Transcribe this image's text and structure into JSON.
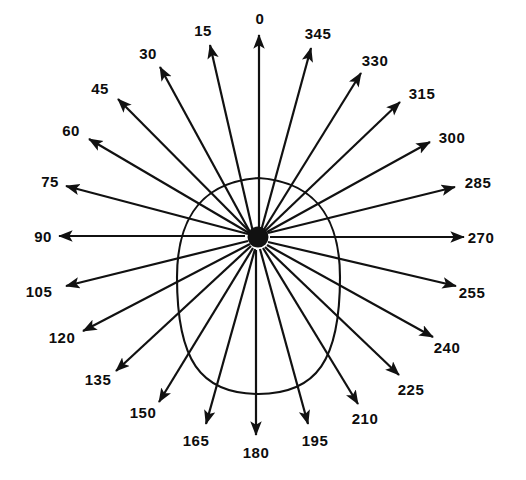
{
  "figure": {
    "type": "polar-direction-diagram",
    "background_color": "#ffffff",
    "stroke_color": "#111111",
    "label_color": "#0d0d0d",
    "width": 526,
    "height": 480,
    "center": {
      "x": 258,
      "y": 237
    },
    "angle_step_degrees": 15,
    "ray_count": 24,
    "label_direction": "counter-clockwise",
    "zero_position": "top"
  },
  "outline": {
    "name": "egg-shaped-curve",
    "top_y": 178,
    "bottom_y": 394,
    "left_x": 177,
    "right_x": 340,
    "description": "closed egg-shaped outline, narrow end upward, drawn around the centre point"
  },
  "chart_data": {
    "type": "line",
    "title": "",
    "subtitle": "",
    "xlabel": "",
    "ylabel": "",
    "legend": [],
    "grid": false,
    "coordinate_system": "polar",
    "angle_unit": "degrees",
    "angles": [
      0,
      15,
      30,
      45,
      60,
      75,
      90,
      105,
      120,
      135,
      150,
      165,
      180,
      195,
      210,
      225,
      240,
      255,
      270,
      285,
      300,
      315,
      330,
      345
    ],
    "tick_labels": [
      "0",
      "15",
      "30",
      "45",
      "60",
      "75",
      "90",
      "105",
      "120",
      "135",
      "150",
      "165",
      "180",
      "195",
      "210",
      "225",
      "240",
      "255",
      "270",
      "285",
      "300",
      "315",
      "330",
      "345"
    ],
    "series": [
      {
        "name": "egg-shaped-outline",
        "values": [
          71,
          72,
          75,
          79,
          79,
          80,
          81,
          86,
          93,
          100,
          107,
          112,
          115,
          112,
          107,
          100,
          93,
          86,
          81,
          80,
          79,
          79,
          75,
          72
        ]
      }
    ]
  },
  "rays": [
    {
      "label": "0",
      "angle": 0,
      "label_x": 260,
      "label_y": 18,
      "arrow_tip_x": 259,
      "arrow_tip_y": 35,
      "tail_x": 259,
      "tail_y": 232
    },
    {
      "label": "15",
      "angle": 15,
      "label_x": 203,
      "label_y": 30,
      "arrow_tip_x": 210,
      "arrow_tip_y": 45,
      "tail_x": 253,
      "tail_y": 232
    },
    {
      "label": "30",
      "angle": 30,
      "label_x": 148,
      "label_y": 53,
      "arrow_tip_x": 160,
      "arrow_tip_y": 67,
      "tail_x": 250,
      "tail_y": 232
    },
    {
      "label": "45",
      "angle": 45,
      "label_x": 100,
      "label_y": 88,
      "arrow_tip_x": 118,
      "arrow_tip_y": 99,
      "tail_x": 250,
      "tail_y": 232
    },
    {
      "label": "60",
      "angle": 60,
      "label_x": 71,
      "label_y": 130,
      "arrow_tip_x": 89,
      "arrow_tip_y": 139,
      "tail_x": 249,
      "tail_y": 233
    },
    {
      "label": "75",
      "angle": 75,
      "label_x": 50,
      "label_y": 181,
      "arrow_tip_x": 66,
      "arrow_tip_y": 186,
      "tail_x": 248,
      "tail_y": 234
    },
    {
      "label": "90",
      "angle": 90,
      "label_x": 43,
      "label_y": 236,
      "arrow_tip_x": 59,
      "arrow_tip_y": 236,
      "tail_x": 245,
      "tail_y": 236
    },
    {
      "label": "105",
      "angle": 105,
      "label_x": 39,
      "label_y": 291,
      "arrow_tip_x": 66,
      "arrow_tip_y": 286,
      "tail_x": 248,
      "tail_y": 241
    },
    {
      "label": "120",
      "angle": 120,
      "label_x": 62,
      "label_y": 337,
      "arrow_tip_x": 83,
      "arrow_tip_y": 331,
      "tail_x": 250,
      "tail_y": 244
    },
    {
      "label": "135",
      "angle": 135,
      "label_x": 98,
      "label_y": 379,
      "arrow_tip_x": 116,
      "arrow_tip_y": 371,
      "tail_x": 251,
      "tail_y": 246
    },
    {
      "label": "150",
      "angle": 150,
      "label_x": 143,
      "label_y": 412,
      "arrow_tip_x": 159,
      "arrow_tip_y": 402,
      "tail_x": 253,
      "tail_y": 248
    },
    {
      "label": "165",
      "angle": 165,
      "label_x": 196,
      "label_y": 440,
      "arrow_tip_x": 206,
      "arrow_tip_y": 424,
      "tail_x": 255,
      "tail_y": 249
    },
    {
      "label": "180",
      "angle": 180,
      "label_x": 256,
      "label_y": 452,
      "arrow_tip_x": 256,
      "arrow_tip_y": 435,
      "tail_x": 256,
      "tail_y": 250
    },
    {
      "label": "195",
      "angle": 195,
      "label_x": 315,
      "label_y": 440,
      "arrow_tip_x": 308,
      "arrow_tip_y": 424,
      "tail_x": 260,
      "tail_y": 249
    },
    {
      "label": "210",
      "angle": 210,
      "label_x": 365,
      "label_y": 418,
      "arrow_tip_x": 358,
      "arrow_tip_y": 404,
      "tail_x": 263,
      "tail_y": 248
    },
    {
      "label": "225",
      "angle": 225,
      "label_x": 411,
      "label_y": 389,
      "arrow_tip_x": 399,
      "arrow_tip_y": 375,
      "tail_x": 265,
      "tail_y": 247
    },
    {
      "label": "240",
      "angle": 240,
      "label_x": 447,
      "label_y": 347,
      "arrow_tip_x": 433,
      "arrow_tip_y": 337,
      "tail_x": 267,
      "tail_y": 245
    },
    {
      "label": "255",
      "angle": 255,
      "label_x": 472,
      "label_y": 292,
      "arrow_tip_x": 456,
      "arrow_tip_y": 286,
      "tail_x": 268,
      "tail_y": 242
    },
    {
      "label": "270",
      "angle": 270,
      "label_x": 481,
      "label_y": 237,
      "arrow_tip_x": 464,
      "arrow_tip_y": 237,
      "tail_x": 270,
      "tail_y": 237
    },
    {
      "label": "285",
      "angle": 285,
      "label_x": 478,
      "label_y": 182,
      "arrow_tip_x": 455,
      "arrow_tip_y": 187,
      "tail_x": 268,
      "tail_y": 233
    },
    {
      "label": "300",
      "angle": 300,
      "label_x": 452,
      "label_y": 137,
      "arrow_tip_x": 430,
      "arrow_tip_y": 142,
      "tail_x": 267,
      "tail_y": 232
    },
    {
      "label": "315",
      "angle": 315,
      "label_x": 422,
      "label_y": 93,
      "arrow_tip_x": 400,
      "arrow_tip_y": 102,
      "tail_x": 265,
      "tail_y": 231
    },
    {
      "label": "330",
      "angle": 330,
      "label_x": 375,
      "label_y": 60,
      "arrow_tip_x": 361,
      "arrow_tip_y": 73,
      "tail_x": 263,
      "tail_y": 231
    },
    {
      "label": "345",
      "angle": 345,
      "label_x": 318,
      "label_y": 33,
      "arrow_tip_x": 311,
      "arrow_tip_y": 48,
      "tail_x": 261,
      "tail_y": 231
    }
  ]
}
